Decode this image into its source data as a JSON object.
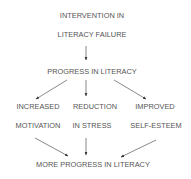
{
  "diagram": {
    "nodes": {
      "intervention_line1": "INTERVENTION IN",
      "intervention_line2": "LITERACY FAILURE",
      "progress": "PROGRESS IN LITERACY",
      "motivation_line1": "INCREASED",
      "motivation_line2": "MOTIVATION",
      "stress_line1": "REDUCTION",
      "stress_line2": "IN STRESS",
      "esteem_line1": "IMPROVED",
      "esteem_line2": "SELF-ESTEEM",
      "more_progress": "MORE PROGRESS IN LITERACY"
    },
    "edges": [
      {
        "from": "INTERVENTION IN LITERACY FAILURE",
        "to": "PROGRESS IN LITERACY"
      },
      {
        "from": "PROGRESS IN LITERACY",
        "to": "INCREASED MOTIVATION"
      },
      {
        "from": "PROGRESS IN LITERACY",
        "to": "REDUCTION IN STRESS"
      },
      {
        "from": "PROGRESS IN LITERACY",
        "to": "IMPROVED SELF-ESTEEM"
      },
      {
        "from": "INCREASED MOTIVATION",
        "to": "MORE PROGRESS IN LITERACY"
      },
      {
        "from": "REDUCTION IN STRESS",
        "to": "MORE PROGRESS IN LITERACY"
      },
      {
        "from": "IMPROVED SELF-ESTEEM",
        "to": "MORE PROGRESS IN LITERACY"
      }
    ],
    "colors": {
      "text": "#555555",
      "arrow": "#555555",
      "background": "#ffffff"
    }
  }
}
